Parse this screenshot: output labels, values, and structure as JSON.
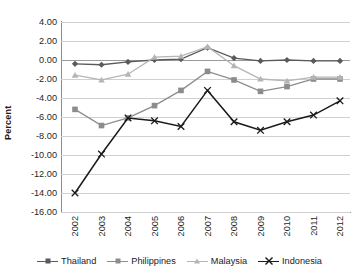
{
  "chart_data": {
    "type": "line",
    "title": "",
    "xlabel": "",
    "ylabel": "Percent",
    "categories": [
      "2002",
      "2003",
      "2004",
      "2005",
      "2006",
      "2007",
      "2008",
      "2009",
      "2010",
      "2011",
      "2012"
    ],
    "ylim": [
      -16.0,
      4.0
    ],
    "ytick_step": 2.0,
    "yticks": [
      "4.00",
      "2.00",
      "0.00",
      "-2.00",
      "-4.00",
      "-6.00",
      "-8.00",
      "-10.00",
      "-12.00",
      "-14.00",
      "-16.00"
    ],
    "ytick_values": [
      4.0,
      2.0,
      0.0,
      -2.0,
      -4.0,
      -6.0,
      -8.0,
      -10.0,
      -12.0,
      -14.0,
      -16.0
    ],
    "grid": true,
    "legend_position": "bottom",
    "series": [
      {
        "name": "Thailand",
        "marker": "diamond",
        "color": "#5a5a5a",
        "values": [
          -0.4,
          -0.5,
          -0.2,
          0.0,
          0.1,
          1.3,
          0.2,
          -0.1,
          0.0,
          -0.1,
          -0.1
        ]
      },
      {
        "name": "Philippines",
        "marker": "square",
        "color": "#8c8c8c",
        "values": [
          -5.2,
          -6.9,
          -6.1,
          -4.8,
          -3.2,
          -1.2,
          -2.1,
          -3.3,
          -2.8,
          -2.0,
          -2.0
        ]
      },
      {
        "name": "Malaysia",
        "marker": "triangle",
        "color": "#b5b5b5",
        "values": [
          -1.6,
          -2.1,
          -1.5,
          0.3,
          0.4,
          1.4,
          -0.6,
          -2.0,
          -2.2,
          -1.8,
          -1.8
        ]
      },
      {
        "name": "Indonesia",
        "marker": "cross",
        "color": "#1a1a1a",
        "values": [
          -14.0,
          -9.9,
          -6.1,
          -6.4,
          -7.0,
          -3.2,
          -6.5,
          -7.4,
          -6.5,
          -5.8,
          -4.3
        ]
      }
    ]
  }
}
